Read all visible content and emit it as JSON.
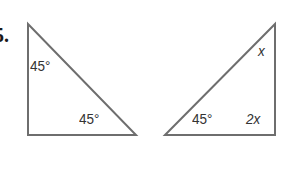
{
  "problem": {
    "number": "5."
  },
  "colors": {
    "stroke": "#6e6e6e",
    "text": "#333333"
  },
  "triangle_left": {
    "vertices": [
      [
        28,
        24
      ],
      [
        28,
        135
      ],
      [
        136,
        135
      ]
    ],
    "angle_top_left": "45°",
    "angle_bottom_right": "45°"
  },
  "triangle_right": {
    "vertices": [
      [
        165,
        135
      ],
      [
        275,
        24
      ],
      [
        275,
        135
      ]
    ],
    "angle_top_right": "x",
    "angle_bottom_left": "45°",
    "angle_bottom_right": "2x"
  }
}
